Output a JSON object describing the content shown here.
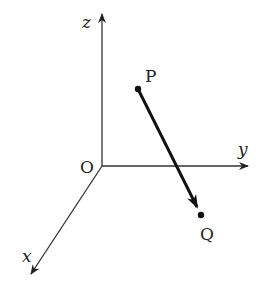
{
  "diagram": {
    "type": "3d-coordinate-vector",
    "colors": {
      "background": "#ffffff",
      "axis": "#333333",
      "vector": "#111111",
      "text": "#222222"
    },
    "origin": {
      "label": "O",
      "x": 102,
      "y": 166
    },
    "axes": [
      {
        "name": "x",
        "label": "x",
        "end": {
          "x": 30,
          "y": 276
        }
      },
      {
        "name": "y",
        "label": "y",
        "end": {
          "x": 250,
          "y": 166
        }
      },
      {
        "name": "z",
        "label": "z",
        "end": {
          "x": 102,
          "y": 12
        }
      }
    ],
    "points": [
      {
        "name": "P",
        "label": "P",
        "x": 138,
        "y": 89
      },
      {
        "name": "Q",
        "label": "Q",
        "x": 201,
        "y": 215
      }
    ],
    "vector": {
      "from": "P",
      "to": "Q",
      "label": "PQ"
    }
  }
}
